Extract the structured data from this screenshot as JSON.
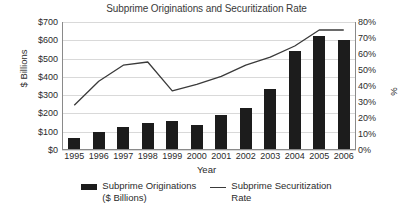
{
  "chart_data": {
    "type": "bar",
    "title": "Subprime Originations and Securitization Rate",
    "xlabel": "Year",
    "ylabel": "$ Billions",
    "ylabel_right": "%",
    "categories": [
      "1995",
      "1996",
      "1997",
      "1998",
      "1999",
      "2000",
      "2001",
      "2002",
      "2003",
      "2004",
      "2005",
      "2006"
    ],
    "series": [
      {
        "name": "Subprime Originations\n($ Billions)",
        "type": "bar",
        "axis": "left",
        "values": [
          65,
          97,
          125,
          150,
          160,
          138,
          190,
          231,
          335,
          540,
          625,
          600
        ]
      },
      {
        "name": "Subprime Securitization\nRate",
        "type": "line",
        "axis": "right",
        "values": [
          28,
          43,
          53,
          55,
          37,
          41,
          46,
          53,
          58,
          65,
          75,
          75
        ]
      }
    ],
    "ylim": [
      0,
      700
    ],
    "ylim_right": [
      0,
      80
    ],
    "yticks": [
      "$0",
      "$100",
      "$200",
      "$300",
      "$400",
      "$500",
      "$600",
      "$700"
    ],
    "ytick_values": [
      0,
      100,
      200,
      300,
      400,
      500,
      600,
      700
    ],
    "yticks_right": [
      "0%",
      "10%",
      "20%",
      "30%",
      "40%",
      "50%",
      "60%",
      "70%",
      "80%"
    ],
    "ytick_values_right": [
      0,
      10,
      20,
      30,
      40,
      50,
      60,
      70,
      80
    ],
    "grid": true,
    "legend_position": "bottom",
    "colors": {
      "bar": "#1c1c1c",
      "line": "#3a3a3a",
      "grid": "#d9d9d9",
      "axis": "#8a8a8a",
      "text": "#2b2b2b",
      "background": "#ffffff"
    }
  },
  "legend": {
    "items": [
      {
        "label": "Subprime Originations\n($ Billions)",
        "marker": "bar-swatch"
      },
      {
        "label": "Subprime Securitization\nRate",
        "marker": "line-swatch"
      }
    ]
  }
}
